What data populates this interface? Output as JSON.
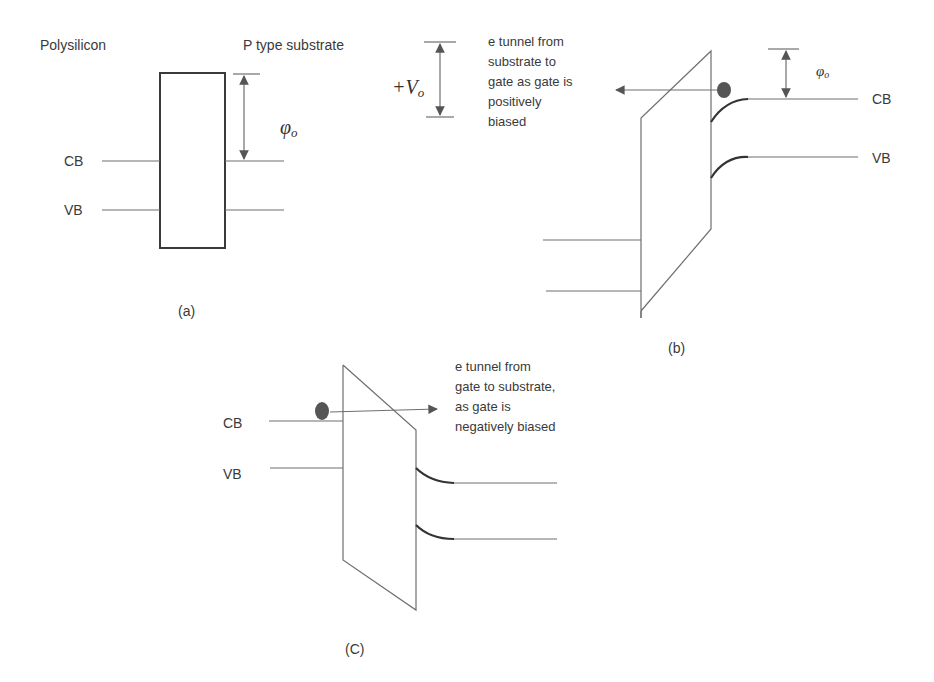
{
  "colors": {
    "line": "#6f6f6f",
    "text": "#3a3a3a",
    "electron": "#555555",
    "background": "#ffffff"
  },
  "panel_a": {
    "caption": "(a)",
    "left_label": "Polysilicon",
    "right_label": "P type substrate",
    "cb_label": "CB",
    "vb_label": "VB",
    "barrier_symbol": "φ",
    "barrier_subscript": "o"
  },
  "panel_b": {
    "caption": "(b)",
    "voltage_sign": "+V",
    "voltage_subscript": "o",
    "note_lines": [
      "e tunnel from",
      "substrate to",
      "gate as gate is",
      "positively",
      "biased"
    ],
    "cb_label": "CB",
    "vb_label": "VB",
    "barrier_symbol": "φ",
    "barrier_subscript": "o"
  },
  "panel_c": {
    "caption": "(C)",
    "cb_label": "CB",
    "vb_label": "VB",
    "note_lines": [
      "e tunnel from",
      "gate to substrate,",
      "as gate is",
      "negatively biased"
    ]
  },
  "icons": {
    "electron": "electron-dot-icon",
    "arrow": "arrowhead-icon"
  }
}
